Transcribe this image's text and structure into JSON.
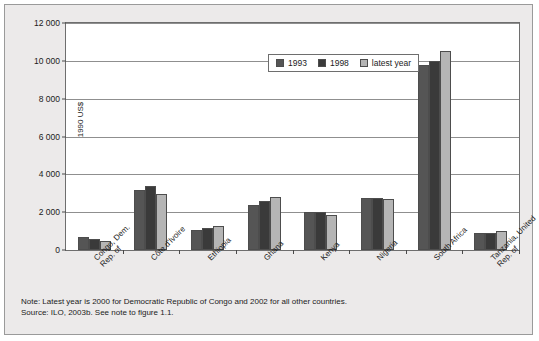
{
  "chart_data": {
    "type": "bar",
    "title": "",
    "xlabel": "",
    "ylabel": "1990 US$",
    "ylim": [
      0,
      12000
    ],
    "ytick_values": [
      0,
      2000,
      4000,
      6000,
      8000,
      10000,
      12000
    ],
    "ytick_labels": [
      "0",
      "2 000",
      "4 000",
      "6 000",
      "8 000",
      "10 000",
      "12 000"
    ],
    "grid": true,
    "legend_position": "top-center",
    "categories": [
      "Congo, Dem.\nRep. of",
      "Côte d'Ivoire",
      "Ethiopia",
      "Ghana",
      "Kenya",
      "Nigeria",
      "South Africa",
      "Tanzania, United\nRep. of"
    ],
    "series": [
      {
        "name": "1993",
        "values": [
          700,
          3150,
          1050,
          2400,
          2000,
          2750,
          9800,
          900
        ]
      },
      {
        "name": "1998",
        "values": [
          600,
          3400,
          1150,
          2600,
          2000,
          2750,
          10000,
          900
        ]
      },
      {
        "name": "latest year",
        "values": [
          480,
          2950,
          1250,
          2800,
          1850,
          2700,
          10500,
          1000
        ]
      }
    ]
  },
  "legend": {
    "items": [
      {
        "label": "1993",
        "color": "#555555"
      },
      {
        "label": "1998",
        "color": "#3a3a3a"
      },
      {
        "label": "latest year",
        "color": "#b5b5b5"
      }
    ]
  },
  "footnotes": {
    "note": "Note: Latest year is 2000 for Democratic Republic of Congo and 2002 for all other countries.",
    "source": "Source: ILO, 2003b. See note to figure 1.1."
  }
}
